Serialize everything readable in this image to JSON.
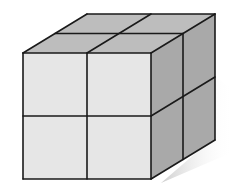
{
  "diagram": {
    "title": "2x2x2 cube made of unit cubes",
    "grid": {
      "rows": 2,
      "cols": 2,
      "depth": 2
    },
    "colors": {
      "front_face": "#e6e6e6",
      "top_face": "#bdbdbd",
      "right_face": "#a9a9a9",
      "edge": "#1a1a1a",
      "shadow": "#d0d0d0",
      "background": "#ffffff"
    },
    "front_face": {
      "x0": 23,
      "y0": 53,
      "x1": 151,
      "y1": 179
    },
    "back_offset": {
      "dx": 64,
      "dy": -39
    }
  }
}
